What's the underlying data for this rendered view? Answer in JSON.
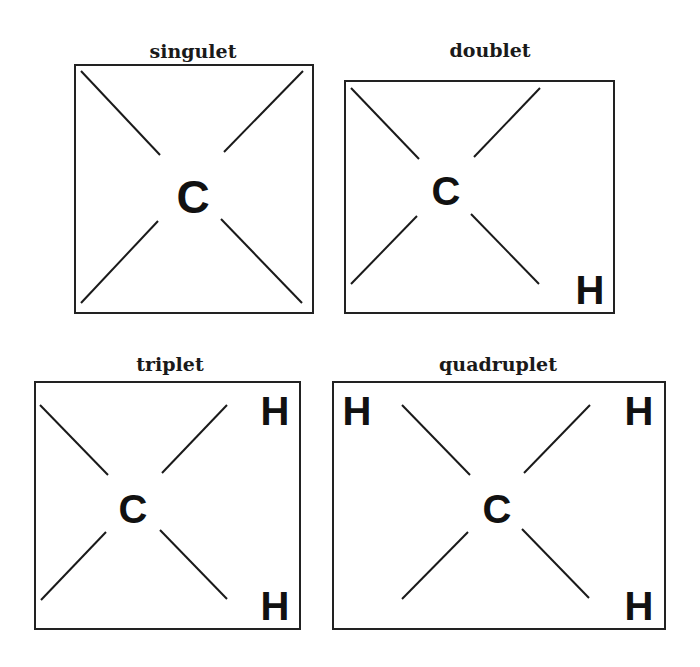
{
  "panels": [
    {
      "id": "singulet",
      "title": "singulet",
      "center_atom": "C",
      "hydrogens": []
    },
    {
      "id": "doublet",
      "title": "doublet",
      "center_atom": "C",
      "hydrogens": [
        {
          "position": "bottom-right",
          "label": "H"
        }
      ]
    },
    {
      "id": "triplet",
      "title": "triplet",
      "center_atom": "C",
      "hydrogens": [
        {
          "position": "top-right",
          "label": "H"
        },
        {
          "position": "bottom-right",
          "label": "H"
        }
      ]
    },
    {
      "id": "quadruplet",
      "title": "quadruplet",
      "center_atom": "C",
      "hydrogens": [
        {
          "position": "top-left",
          "label": "H"
        },
        {
          "position": "top-right",
          "label": "H"
        },
        {
          "position": "bottom-right",
          "label": "H"
        }
      ]
    }
  ]
}
